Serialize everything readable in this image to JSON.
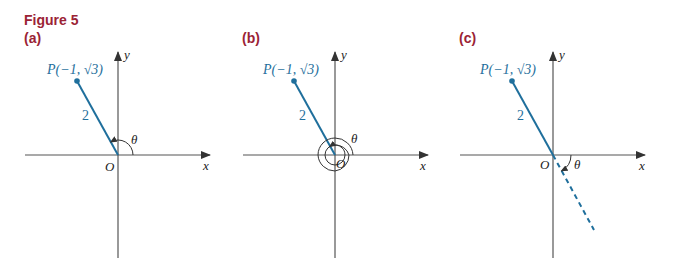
{
  "figure": {
    "title": "Figure 5",
    "colors": {
      "title": "#9b2335",
      "segment": "#1f6f9c",
      "axes": "#555555",
      "text": "#222222"
    },
    "panels": [
      {
        "label": "(a)",
        "point_label": "P(−1, √3)",
        "segment_length_label": "2",
        "origin_label": "O",
        "x_axis_label": "x",
        "y_axis_label": "y",
        "angle_label": "θ",
        "angle_description": "2π/3 measured counterclockwise"
      },
      {
        "label": "(b)",
        "point_label": "P(−1, √3)",
        "segment_length_label": "2",
        "origin_label": "O",
        "x_axis_label": "x",
        "y_axis_label": "y",
        "angle_label": "θ",
        "angle_description": "full revolution plus 2π/3 counterclockwise"
      },
      {
        "label": "(c)",
        "point_label": "P(−1, √3)",
        "segment_length_label": "2",
        "origin_label": "O",
        "x_axis_label": "x",
        "y_axis_label": "y",
        "angle_label": "θ",
        "angle_description": "−π/3 measured clockwise, dashed extension through origin"
      }
    ]
  }
}
